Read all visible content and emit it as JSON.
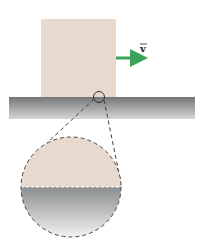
{
  "diagram": {
    "velocity_label": "v",
    "colors": {
      "block": "#e8d9cf",
      "surface_top": "#7a7a7a",
      "surface_bottom": "#d8d8d8",
      "arrow": "#3aa35a",
      "dash": "#444444"
    }
  }
}
